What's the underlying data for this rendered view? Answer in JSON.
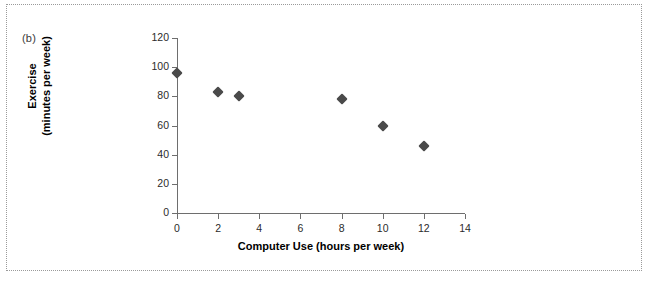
{
  "figure": {
    "panel_label": "(b)",
    "background_color": "#ffffff",
    "border_color": "#9a9a9a",
    "marker_color": "#4a4a4a",
    "axis_color": "#6e6e6e"
  },
  "chart_data": {
    "type": "scatter",
    "title": "",
    "xlabel": "Computer Use (hours per week)",
    "ylabel_line1": "Exercise",
    "ylabel_line2": "(minutes per week)",
    "ylabel": "Exercise (minutes per week)",
    "xlim": [
      0,
      14
    ],
    "ylim": [
      0,
      120
    ],
    "xticks": [
      0,
      2,
      4,
      6,
      8,
      10,
      12,
      14
    ],
    "yticks": [
      0,
      20,
      40,
      60,
      80,
      100,
      120
    ],
    "xticklabels": [
      "0",
      "2",
      "4",
      "6",
      "8",
      "10",
      "12",
      "14"
    ],
    "yticklabels": [
      "0",
      "20",
      "40",
      "60",
      "80",
      "100",
      "120"
    ],
    "grid": false,
    "legend": false,
    "marker": "diamond",
    "series": [
      {
        "name": "Exercise vs Computer Use",
        "points": [
          {
            "x": 0,
            "y": 96
          },
          {
            "x": 2,
            "y": 83
          },
          {
            "x": 3,
            "y": 80
          },
          {
            "x": 8,
            "y": 78
          },
          {
            "x": 10,
            "y": 60
          },
          {
            "x": 12,
            "y": 46
          }
        ]
      }
    ]
  }
}
